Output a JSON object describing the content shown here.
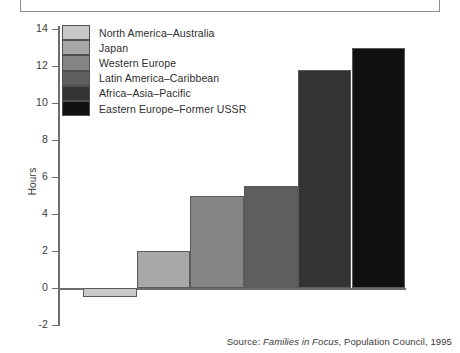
{
  "top_frame": {
    "content": ""
  },
  "chart_data": {
    "type": "bar",
    "title": "",
    "xlabel": "",
    "ylabel": "Hours",
    "ylim": [
      -2,
      14
    ],
    "ytick_step": 2,
    "yticks": [
      14,
      12,
      10,
      8,
      6,
      4,
      2,
      0,
      -2
    ],
    "ytick_labels": [
      "14",
      "12",
      "10",
      "8",
      "6",
      "4",
      "2",
      "0",
      "-2"
    ],
    "grid": false,
    "legend_position": "top-left-inside",
    "categories": [
      "North America–Australia",
      "Japan",
      "Western Europe",
      "Latin America–Caribbean",
      "Africa–Asia–Pacific",
      "Eastern Europe–Former USSR"
    ],
    "values": [
      -0.5,
      2.0,
      5.0,
      5.5,
      11.8,
      13.0
    ],
    "colors": [
      "#c9c9c9",
      "#a8a8a8",
      "#858585",
      "#5e5e5e",
      "#333333",
      "#111111"
    ],
    "bar_gap": 0
  },
  "legend": {
    "items": [
      {
        "label": "North America–Australia",
        "color": "#c9c9c9"
      },
      {
        "label": "Japan",
        "color": "#a8a8a8"
      },
      {
        "label": "Western Europe",
        "color": "#858585"
      },
      {
        "label": "Latin America–Caribbean",
        "color": "#5e5e5e"
      },
      {
        "label": "Africa–Asia–Pacific",
        "color": "#333333"
      },
      {
        "label": "Eastern Europe–Former USSR",
        "color": "#111111"
      }
    ]
  },
  "source": {
    "prefix": "Source: ",
    "italic_title": "Families in Focus",
    "suffix": ", Population Council, 1995"
  }
}
